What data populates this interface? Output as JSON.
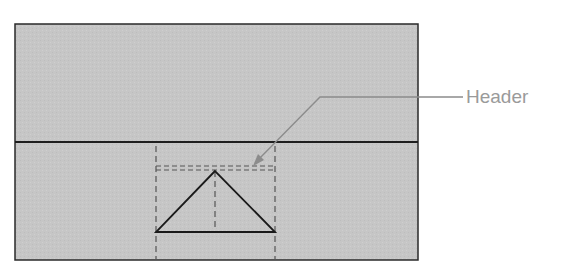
{
  "diagram": {
    "callout_label": "Header",
    "colors": {
      "panel_fill": "#c6c6c6",
      "panel_stroke": "#2a2a2a",
      "dashed_guide": "#555555",
      "callout": "#8c8c8c",
      "label_text": "#9a9a9a"
    },
    "shapes": {
      "outer_rect": {
        "x": 15,
        "y": 24,
        "w": 403,
        "h": 236
      },
      "divider_y": 142,
      "triangle": {
        "apex": [
          215,
          171
        ],
        "left": [
          156,
          232
        ],
        "right": [
          275,
          232
        ]
      },
      "dashed_verticals_x": [
        156,
        215,
        275
      ],
      "dashed_header_box": {
        "x": 156,
        "y": 166,
        "w": 119,
        "h": 5
      }
    }
  }
}
